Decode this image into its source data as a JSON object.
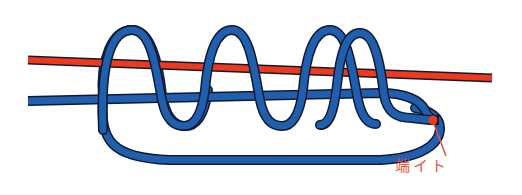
{
  "diagram": {
    "title": "",
    "type": "fishing knot illustration",
    "colors": {
      "main_line": "#ee3a1c",
      "leader_line": "#1f5fae",
      "outline": "#0e1a33",
      "label": "#e8553a"
    },
    "elements": [
      {
        "id": "main-line",
        "description": "red straight line"
      },
      {
        "id": "leader-line",
        "description": "blue line wrapped with 4 coils around both lines, forming loop"
      },
      {
        "id": "tag-end",
        "description": "cut end of blue line marked red"
      }
    ],
    "label": {
      "text": "端イト"
    }
  }
}
